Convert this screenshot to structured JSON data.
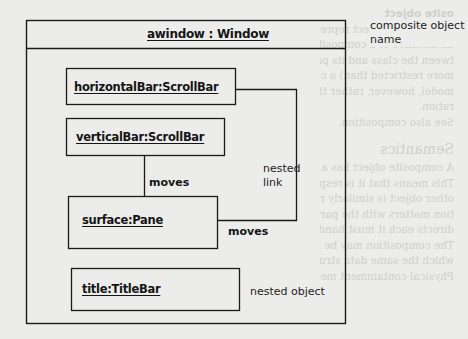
{
  "diagram": {
    "type": "uml-composite-object",
    "composite": {
      "name": "awindow : Window"
    },
    "parts": [
      {
        "id": "horizontalBar",
        "name": "horizontalBar:ScrollBar"
      },
      {
        "id": "verticalBar",
        "name": "verticalBar:ScrollBar"
      },
      {
        "id": "surface",
        "name": "surface:Pane"
      },
      {
        "id": "title",
        "name": "title:TitleBar"
      }
    ],
    "links": [
      {
        "from": "verticalBar",
        "to": "surface",
        "label": "moves"
      },
      {
        "from": "horizontalBar",
        "to": "surface",
        "label": "moves"
      }
    ],
    "annotations": {
      "composite_name_line1": "composite object",
      "composite_name_line2": "name",
      "nested_link_line1": "nested",
      "nested_link_line2": "link",
      "nested_object": "nested object"
    }
  },
  "bleed_through": {
    "lines": [
      "osite object",
      "A composite object represents a high-level",
      "an instance of a composite class; it implies",
      "tween the class and its parts. A composite",
      "more restricted than) a collaboration. It is",
      "model, however, rather than by the object",
      "ration.",
      "See also composition."
    ],
    "heading": "Semantics",
    "lines2": [
      "A composite object has a composition relationship",
      "This means that it is responsible for creating",
      "other object is similarly responsible. In other",
      "tion matters with the parts; the composite",
      "directs each it must hand over responsibility",
      "The composition may be implemented by",
      "which the same data structure as the",
      "Physical containment means that the lifetime"
    ]
  }
}
